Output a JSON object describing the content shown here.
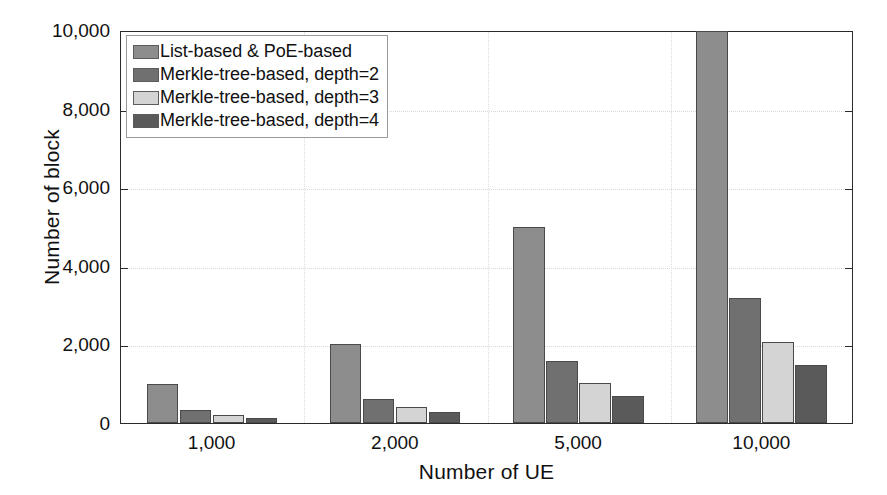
{
  "chart_data": {
    "type": "bar",
    "title": "",
    "xlabel": "Number of UE",
    "ylabel": "Number of block",
    "categories": [
      "1,000",
      "2,000",
      "5,000",
      "10,000"
    ],
    "series": [
      {
        "name": "List-based & PoE-based",
        "color": "#8d8d8d",
        "values": [
          1000,
          2000,
          5000,
          10000
        ]
      },
      {
        "name": "Merkle-tree-based, depth=2",
        "color": "#707070",
        "values": [
          340,
          620,
          1580,
          3170
        ]
      },
      {
        "name": "Merkle-tree-based, depth=3",
        "color": "#d4d4d4",
        "values": [
          210,
          420,
          1020,
          2050
        ]
      },
      {
        "name": "Merkle-tree-based, depth=4",
        "color": "#5a5a5a",
        "values": [
          140,
          280,
          700,
          1470
        ]
      }
    ],
    "ylim": [
      0,
      10000
    ],
    "yticks": [
      0,
      2000,
      4000,
      6000,
      8000,
      10000
    ],
    "ytick_labels": [
      "0",
      "2,000",
      "4,000",
      "6,000",
      "8,000",
      "10,000"
    ],
    "grid": true,
    "legend_position": "upper-left",
    "background_color": "#ffffff",
    "axis_color": "#2b2b2b"
  }
}
